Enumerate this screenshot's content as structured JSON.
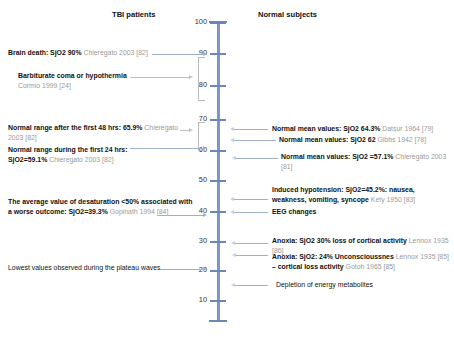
{
  "headers": {
    "left": "TBI patients",
    "right": "Normal subjects"
  },
  "axis": {
    "label": "SjO2 (%)",
    "ticks": [
      "100",
      "90",
      "80",
      "70",
      "60",
      "50",
      "40",
      "30",
      "20",
      "10"
    ],
    "tick_values": [
      100,
      90,
      80,
      70,
      60,
      50,
      40,
      30,
      20,
      10
    ],
    "min": 0,
    "max": 100,
    "color": "#7d96c4"
  },
  "left_annotations": [
    {
      "id": "brain-death",
      "text": "Brain death: SjO2 90% ",
      "citation": "Chieregato 2003 [82]",
      "value": 90
    },
    {
      "id": "barbiturate-coma",
      "text": "Barbiturate coma or hypothermia",
      "citation": "Cormio 1999 [24]",
      "range": [
        88,
        75
      ]
    },
    {
      "id": "normal-range-48hrs",
      "text": "Normal range after the first 48 hrs: 65.9% ",
      "citation": "Chieregato 2003 [82]",
      "range": [
        70,
        64
      ]
    },
    {
      "id": "normal-range-24hrs",
      "text": "Normal range during the first 24 hrs: SjO2=59.1% ",
      "citation": "Chieregato 2003 [82]",
      "value": 60
    },
    {
      "id": "desaturation-outcome",
      "text": "The average value of desaturation <50% associated with a worse outcome: SjO2=39.3% ",
      "citation": "Gopinath 1994 [84]",
      "value": 39.3
    },
    {
      "id": "plateau-waves",
      "text": "Lowest values observed during the plateau waves",
      "citation": "",
      "value": 20
    }
  ],
  "right_annotations": [
    {
      "id": "normal-mean-datsur",
      "text": "Normal mean values: SjO2 64.3% ",
      "citation": "Datsur 1964 [79]",
      "value": 64.3
    },
    {
      "id": "normal-mean-gibbs",
      "text": "Normal mean values: SjO2 62 ",
      "citation": "Gibbs 1942 [78]",
      "value": 62
    },
    {
      "id": "normal-mean-chieregato",
      "text": "Normal mean values:  SjO2 =57.1% ",
      "citation": "Chieregato 2003 [81]",
      "value": 57.1
    },
    {
      "id": "induced-hypotension",
      "text": "Induced hypotension: SjO2=45.2%: nausea, weakness, vomiting, syncope ",
      "citation": "Kety 1950 [83]",
      "value": 45.2
    },
    {
      "id": "eeg-changes",
      "text": "EEG changes",
      "citation": "",
      "value": 40
    },
    {
      "id": "anoxia-30",
      "text": "Anoxia: SjO2 30% loss of cortical activity ",
      "citation": "Lennox 1935 [86]",
      "value": 30
    },
    {
      "id": "anoxia-24",
      "text": "Anoxia: SjO2: 24% Unconscioussnes ",
      "citation": "Lennox 1935 [85]",
      "text2": " – cortical loss activity ",
      "citation2": "Gotoh 1965 [85]",
      "value": 24
    },
    {
      "id": "depletion-metabolites",
      "text": "Depletion of energy metabolites",
      "citation": "",
      "value": 14
    }
  ]
}
